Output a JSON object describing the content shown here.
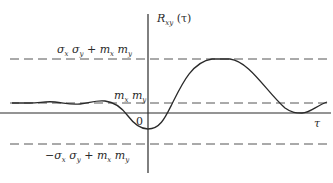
{
  "diagram": {
    "y_axis_label": {
      "main": "R",
      "sub": "xy",
      "arg": "(τ)"
    },
    "x_axis_label": "τ",
    "origin_label": "0",
    "levels": {
      "upper": {
        "label_parts": [
          "σ",
          "x",
          " σ",
          "y",
          " + m",
          "x",
          " m",
          "y"
        ],
        "text": "σx σy + mx my"
      },
      "mean": {
        "label_parts": [
          "m",
          "x",
          " m",
          "y"
        ],
        "text": "mx my"
      },
      "lower": {
        "label_parts": [
          "−σ",
          "x",
          " σ",
          "y",
          " + m",
          "x",
          " m",
          "y"
        ],
        "text": "−σx σy + mx my"
      }
    },
    "colors": {
      "line": "#2a2a2a",
      "dash": "#555555"
    }
  }
}
